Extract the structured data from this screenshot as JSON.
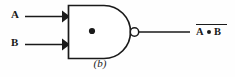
{
  "figure": {
    "caption": "(b)",
    "gate_type": "NAND",
    "stroke_color": "#1a1a1a",
    "background_color": "#fefefe"
  },
  "inputs": [
    {
      "label": "A",
      "name": "input-a"
    },
    {
      "label": "B",
      "name": "input-b"
    }
  ],
  "gate": {
    "body_symbol": "•",
    "has_inversion_bubble": true
  },
  "output": {
    "operand_left": "A",
    "operator": "•",
    "operand_right": "B",
    "overbar": true,
    "expression": "A • B"
  }
}
